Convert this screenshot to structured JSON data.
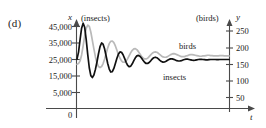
{
  "panel": {
    "label": "(d)"
  },
  "chart_data": {
    "type": "line",
    "title": "",
    "xlabel": "t",
    "grid": false,
    "legend_position": "inline-annotations",
    "axes": {
      "x": {
        "label": "t",
        "origin_label": "0",
        "arrow": true
      },
      "y_left": {
        "variable": "x",
        "unit_label": "(insects)",
        "ticks": [
          "45,000",
          "35,000",
          "25,000",
          "15,000",
          "5,000"
        ],
        "tick_values": [
          45000,
          35000,
          25000,
          15000,
          5000
        ],
        "ylim": [
          0,
          50000
        ],
        "arrow": true
      },
      "y_right": {
        "variable": "y",
        "unit_label": "(birds)",
        "ticks": [
          "250",
          "200",
          "150",
          "100",
          "50"
        ],
        "tick_values": [
          250,
          200,
          150,
          100,
          50
        ],
        "ylim": [
          0,
          280
        ],
        "arrow": true
      }
    },
    "series": [
      {
        "name": "insects",
        "annotation": "insects",
        "axis": "y_left",
        "color": "#111111",
        "steady_state": 25000,
        "initial": 25000,
        "peak": 47000,
        "values": [
          25200,
          29500,
          37000,
          44000,
          47000,
          44500,
          37000,
          28000,
          20000,
          15200,
          14100,
          15600,
          19000,
          23500,
          28500,
          32800,
          35000,
          34300,
          31300,
          27000,
          22600,
          19200,
          17400,
          17600,
          19600,
          22600,
          25800,
          28300,
          29600,
          29400,
          27900,
          25700,
          23300,
          21400,
          20600,
          21000,
          22400,
          24300,
          26000,
          27200,
          27500,
          27000,
          25900,
          24500,
          23300,
          22600,
          22600,
          23200,
          24200,
          25300,
          26100,
          26400,
          26100,
          25400,
          24500,
          23800,
          23400,
          23500,
          23900,
          24500,
          25100,
          25400,
          25400,
          25100,
          24700,
          24300,
          24100,
          24100,
          24300,
          24700,
          25000,
          25200,
          25200,
          25000,
          24800,
          24600,
          24500,
          24600,
          24800,
          25000,
          25100,
          25100,
          25000,
          24900,
          24800,
          24800,
          24900,
          25000,
          25000,
          25000,
          25000,
          24950,
          24950,
          25000,
          25000,
          25000,
          25000,
          25000,
          25000,
          25000
        ]
      },
      {
        "name": "birds",
        "annotation": "birds",
        "axis": "y_right",
        "color": "#b9b9b9",
        "steady_state": 175,
        "initial": 150,
        "peak": 268,
        "values": [
          150,
          152,
          160,
          178,
          205,
          235,
          258,
          268,
          264,
          247,
          222,
          196,
          172,
          154,
          143,
          140,
          143,
          152,
          166,
          183,
          199,
          212,
          219,
          220,
          215,
          205,
          192,
          179,
          168,
          160,
          156,
          156,
          160,
          167,
          176,
          185,
          192,
          196,
          197,
          194,
          188,
          181,
          174,
          169,
          166,
          166,
          168,
          173,
          178,
          183,
          186,
          187,
          186,
          183,
          179,
          175,
          172,
          171,
          171,
          173,
          176,
          179,
          181,
          182,
          181,
          179,
          177,
          175,
          173,
          173,
          173,
          175,
          176,
          178,
          179,
          179,
          178,
          177,
          176,
          175,
          174,
          174,
          175,
          175,
          176,
          177,
          177,
          176,
          176,
          175,
          175,
          175,
          175,
          176,
          176,
          176,
          175,
          175,
          175,
          175
        ]
      }
    ]
  }
}
